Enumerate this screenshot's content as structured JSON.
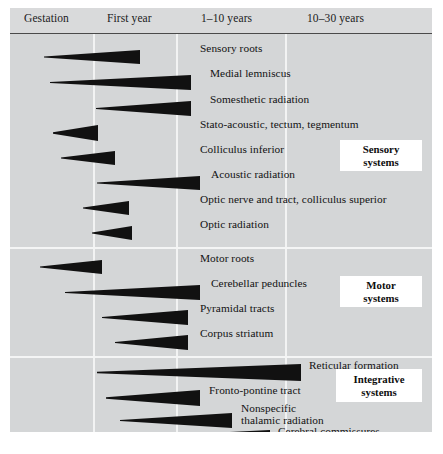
{
  "figure": {
    "title_visible": false,
    "background_color": "#d4d6d7",
    "header_color": "#d9dadb",
    "wedge_color": "#111111",
    "divider_color": "#f2f3f3"
  },
  "header": {
    "columns": [
      {
        "label": "Gestation"
      },
      {
        "label": "First year"
      },
      {
        "label": "1–10 years"
      },
      {
        "label": "10–30 years"
      }
    ]
  },
  "groups": [
    {
      "id": "sensory",
      "label_line1": "Sensory",
      "label_line2": "systems"
    },
    {
      "id": "motor",
      "label_line1": "Motor",
      "label_line2": "systems"
    },
    {
      "id": "integrative",
      "label_line1": "Integrative",
      "label_line2": "systems"
    }
  ],
  "chart_data": {
    "type": "bar",
    "xlabel": "",
    "ylabel": "",
    "categories": [
      "Sensory roots",
      "Medial lemniscus",
      "Somesthetic radiation",
      "Stato-acoustic, tectum, tegmentum",
      "Colliculus inferior",
      "Acoustic radiation",
      "Optic nerve and tract, colliculus superior",
      "Optic radiation",
      "Motor roots",
      "Cerebellar peduncles",
      "Pyramidal tracts",
      "Corpus striatum",
      "Reticular formation",
      "Fronto-pontine tract",
      "Nonspecific thalamic radiation",
      "Cerebral commissures",
      "Intra-cortical association area"
    ],
    "x_axis_segments": [
      "Gestation",
      "First year",
      "1–10 years",
      "10–30 years"
    ],
    "legend_position": "right",
    "grid": true,
    "series": [
      {
        "name": "Myelination span (wedge start → end, in px of plot width)",
        "values": [
          {
            "label": "Sensory roots",
            "start": 34,
            "end": 130,
            "group": "sensory"
          },
          {
            "label": "Medial lemniscus",
            "start": 40,
            "end": 181,
            "group": "sensory"
          },
          {
            "label": "Somesthetic radiation",
            "start": 86,
            "end": 181,
            "group": "sensory"
          },
          {
            "label": "Stato-acoustic, tectum, tegmentum",
            "start": 43,
            "end": 88,
            "group": "sensory"
          },
          {
            "label": "Colliculus inferior",
            "start": 51,
            "end": 105,
            "group": "sensory"
          },
          {
            "label": "Acoustic radiation",
            "start": 87,
            "end": 190,
            "group": "sensory"
          },
          {
            "label": "Optic nerve and tract, colliculus superior",
            "start": 73,
            "end": 119,
            "group": "sensory"
          },
          {
            "label": "Optic radiation",
            "start": 82,
            "end": 122,
            "group": "sensory"
          },
          {
            "label": "Motor roots",
            "start": 30,
            "end": 92,
            "group": "motor"
          },
          {
            "label": "Cerebellar peduncles",
            "start": 55,
            "end": 190,
            "group": "motor"
          },
          {
            "label": "Pyramidal tracts",
            "start": 92,
            "end": 178,
            "group": "motor"
          },
          {
            "label": "Corpus striatum",
            "start": 105,
            "end": 178,
            "group": "motor"
          },
          {
            "label": "Reticular formation",
            "start": 87,
            "end": 291,
            "group": "integrative"
          },
          {
            "label": "Fronto-pontine tract",
            "start": 96,
            "end": 190,
            "group": "integrative"
          },
          {
            "label": "Nonspecific thalamic radiation",
            "start": 110,
            "end": 222,
            "group": "integrative"
          },
          {
            "label": "Cerebral commissures",
            "start": 112,
            "end": 260,
            "group": "integrative"
          },
          {
            "label": "Intra-cortical association area",
            "start": 115,
            "end": 367,
            "group": "integrative"
          }
        ]
      }
    ]
  },
  "rows": [
    {
      "label": "Sensory roots",
      "label_x": 190,
      "label_y": 18,
      "w_left": 34,
      "w_right": 130,
      "w_y": 16,
      "w_h": 14,
      "two_line": false
    },
    {
      "label": "Medial lemniscus",
      "label_x": 200,
      "label_y": 43,
      "w_left": 40,
      "w_right": 181,
      "w_y": 41,
      "w_h": 15,
      "two_line": false
    },
    {
      "label": "Somesthetic radiation",
      "label_x": 200,
      "label_y": 69,
      "w_left": 86,
      "w_right": 181,
      "w_y": 67,
      "w_h": 15,
      "two_line": false
    },
    {
      "label": "Stato-acoustic, tectum, tegmentum",
      "label_x": 190,
      "label_y": 94,
      "w_left": 43,
      "w_right": 88,
      "w_y": 91,
      "w_h": 16,
      "two_line": false
    },
    {
      "label": "Colliculus inferior",
      "label_x": 190,
      "label_y": 119,
      "w_left": 51,
      "w_right": 105,
      "w_y": 117,
      "w_h": 14,
      "two_line": false
    },
    {
      "label": "Acoustic radiation",
      "label_x": 201,
      "label_y": 144,
      "w_left": 87,
      "w_right": 190,
      "w_y": 142,
      "w_h": 14,
      "two_line": false
    },
    {
      "label": "Optic nerve and tract, colliculus superior",
      "label_x": 190,
      "label_y": 169,
      "w_left": 73,
      "w_right": 119,
      "w_y": 167,
      "w_h": 14,
      "two_line": false
    },
    {
      "label": "Optic radiation",
      "label_x": 190,
      "label_y": 194,
      "w_left": 82,
      "w_right": 122,
      "w_y": 192,
      "w_h": 14,
      "two_line": false
    },
    {
      "label": "Motor roots",
      "label_x": 190,
      "label_y": 228,
      "w_left": 30,
      "w_right": 92,
      "w_y": 226,
      "w_h": 14,
      "two_line": false
    },
    {
      "label": "Cerebellar peduncles",
      "label_x": 201,
      "label_y": 253,
      "w_left": 55,
      "w_right": 190,
      "w_y": 251,
      "w_h": 15,
      "two_line": false
    },
    {
      "label": "Pyramidal tracts",
      "label_x": 190,
      "label_y": 278,
      "w_left": 92,
      "w_right": 178,
      "w_y": 276,
      "w_h": 15,
      "two_line": false
    },
    {
      "label": "Corpus striatum",
      "label_x": 190,
      "label_y": 303,
      "w_left": 105,
      "w_right": 178,
      "w_y": 301,
      "w_h": 15,
      "two_line": false
    },
    {
      "label": "Reticular formation",
      "label_x": 299,
      "label_y": 335,
      "w_left": 87,
      "w_right": 291,
      "w_y": 330,
      "w_h": 17,
      "two_line": false
    },
    {
      "label": "Fronto-pontine tract",
      "label_x": 199,
      "label_y": 360,
      "w_left": 96,
      "w_right": 190,
      "w_y": 356,
      "w_h": 16,
      "two_line": false
    },
    {
      "label": "Nonspecific\nthalamic radiation",
      "label_x": 231,
      "label_y": 378,
      "w_left": 110,
      "w_right": 222,
      "w_y": 379,
      "w_h": 15,
      "two_line": true
    },
    {
      "label": "Cerebral commissures",
      "label_x": 268,
      "label_y": 401,
      "w_left": 112,
      "w_right": 260,
      "w_y": 396,
      "w_h": 16,
      "two_line": false
    },
    {
      "label": "Intra-cortical association area",
      "label_x": 270,
      "label_y": 424,
      "w_left": 115,
      "w_right": 367,
      "w_y": 405,
      "w_h": 16,
      "two_line": false
    }
  ],
  "section_dividers_y": [
    213,
    322
  ],
  "column_dividers_x": [
    83,
    166,
    275
  ]
}
